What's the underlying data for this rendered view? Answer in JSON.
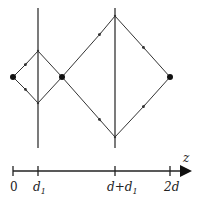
{
  "diagram": {
    "colors": {
      "line": "#333333",
      "point": "#111111",
      "background": "#ffffff"
    },
    "points": [
      {
        "name": "source",
        "x": 13,
        "y": 77
      },
      {
        "name": "focus-middle",
        "x": 62,
        "y": 77
      },
      {
        "name": "image-right",
        "x": 170,
        "y": 77
      }
    ],
    "vertical_lines": [
      {
        "name": "lens-1",
        "x": 38,
        "y1": 8,
        "y2": 148
      },
      {
        "name": "lens-2",
        "x": 115,
        "y1": 8,
        "y2": 148
      }
    ],
    "axis": {
      "label": "z",
      "ticks": [
        {
          "x": 13,
          "label": "0"
        },
        {
          "x": 38,
          "label": "d",
          "sub": "1"
        },
        {
          "x": 115,
          "label": "d+d",
          "sub": "1"
        },
        {
          "x": 170,
          "label": "2d"
        }
      ]
    }
  }
}
